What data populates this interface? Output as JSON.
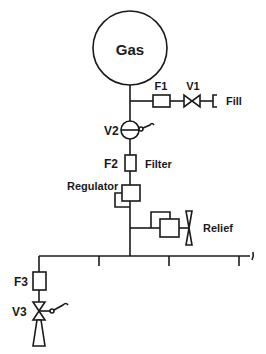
{
  "diagram": {
    "type": "gas supply schematic",
    "colors": {
      "line": "#1a1a1a",
      "background": "#ffffff"
    },
    "tank": {
      "label": "Gas"
    },
    "fill_branch": {
      "filter_label": "F1",
      "valve_label": "V1",
      "outlet_label": "Fill"
    },
    "main_valve": {
      "label": "V2"
    },
    "filter": {
      "id_label": "F2",
      "name_label": "Filter"
    },
    "regulator": {
      "label": "Regulator"
    },
    "relief": {
      "label": "Relief"
    },
    "outlet_branch": {
      "filter_label": "F3",
      "valve_label": "V3"
    }
  }
}
